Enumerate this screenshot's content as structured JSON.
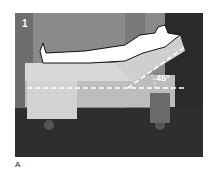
{
  "figure": {
    "panel_number": "1",
    "angle_label": "45°",
    "caption_letter": "A",
    "colors": {
      "background": "#3a3a3a",
      "wall": "#8a8a8a",
      "floor": "#2e2e2e",
      "mattress": "#cfcfcf",
      "silhouette_fill": "#ffffff",
      "silhouette_outline": "#111111",
      "dashed_line": "#ffffff"
    }
  }
}
